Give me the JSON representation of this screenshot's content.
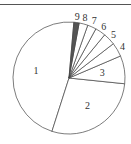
{
  "chart_data": {
    "type": "pie",
    "title": "",
    "categories": [
      "1",
      "2",
      "3",
      "4",
      "5",
      "6",
      "7",
      "8",
      "9"
    ],
    "values": [
      46,
      28,
      8,
      4,
      3.5,
      3,
      2.5,
      2.5,
      1.5
    ],
    "start_angle_deg": 5,
    "direction": "counterclockwise",
    "colors": [
      "#ffffff",
      "#ffffff",
      "#ffffff",
      "#ffffff",
      "#ffffff",
      "#ffffff",
      "#ffffff",
      "#ffffff",
      "#555555"
    ]
  },
  "labels": [
    "1",
    "2",
    "3",
    "4",
    "5",
    "6",
    "7",
    "8",
    "9"
  ]
}
